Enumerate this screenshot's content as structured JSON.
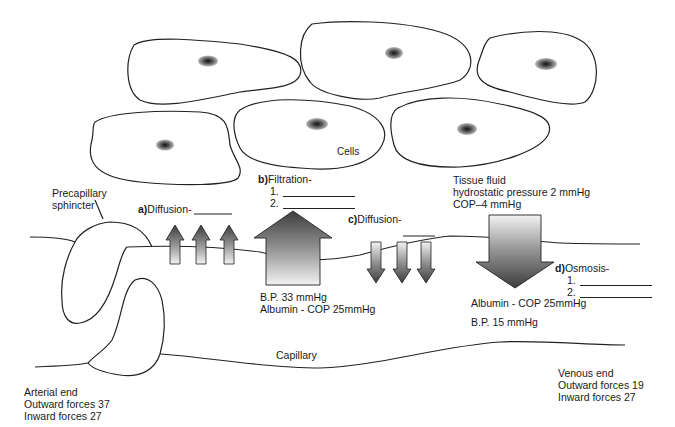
{
  "diagram": {
    "cells_label": "Cells",
    "precapillary_label_line1": "Precapillary",
    "precapillary_label_line2": "sphincter",
    "capillary_label": "Capillary",
    "a": {
      "letter": "a)",
      "label": "Diffusion-"
    },
    "b": {
      "letter": "b)",
      "label": "Filtration-",
      "item1": "1.",
      "item2": "2."
    },
    "c": {
      "letter": "c)",
      "label": "Diffusion-"
    },
    "d": {
      "letter": "d)",
      "label": "Osmosis-",
      "item1": "1.",
      "item2": "2."
    },
    "tissue_fluid": {
      "title": "Tissue fluid",
      "line2": "hydrostatic pressure 2 mmHg",
      "line3": "COP–4 mmHg"
    },
    "arterial_pressures": {
      "bp": "B.P.  33 mmHg",
      "cop": "Albumin - COP  25mmHg"
    },
    "venous_pressures": {
      "cop": "Albumin - COP 25mmHg",
      "bp": "B.P.  15 mmHg"
    },
    "arterial_end": {
      "title": "Arterial end",
      "outward": "Outward forces 37",
      "inward": "Inward forces 27"
    },
    "venous_end": {
      "title": "Venous end",
      "outward": "Outward forces 19",
      "inward": "Inward forces 27"
    },
    "colors": {
      "line": "#222222",
      "arrow_dark": "#4a4a4a",
      "arrow_light": "#e6e6e6"
    }
  }
}
